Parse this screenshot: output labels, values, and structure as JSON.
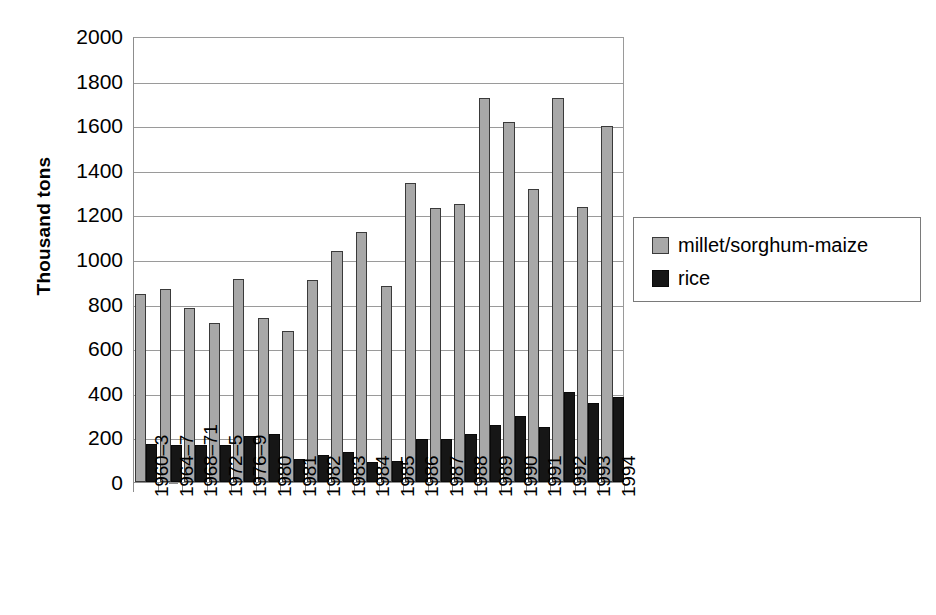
{
  "chart_data": {
    "type": "bar",
    "title": "",
    "xlabel": "",
    "ylabel": "Thousand tons",
    "ylim": [
      0,
      2000
    ],
    "ytick_step": 200,
    "yticks": [
      2000,
      1800,
      1600,
      1400,
      1200,
      1000,
      800,
      600,
      400,
      200,
      0
    ],
    "grid": true,
    "legend_position": "right",
    "categories": [
      "1960–3",
      "1964–7",
      "1968–71",
      "1972–5",
      "1976–9",
      "1980",
      "1981",
      "1982",
      "1983",
      "1984",
      "1985",
      "1986",
      "1987",
      "1988",
      "1989",
      "1990",
      "1991",
      "1992",
      "1993",
      "1994"
    ],
    "series": [
      {
        "name": "millet/sorghum-maize",
        "color": "#a8a8a8",
        "values": [
          845,
          865,
          780,
          715,
          910,
          735,
          675,
          905,
          1035,
          1120,
          880,
          1340,
          1230,
          1245,
          1720,
          1615,
          1315,
          1720,
          1235,
          1595
        ]
      },
      {
        "name": "rice",
        "color": "#161616",
        "values": [
          170,
          165,
          165,
          165,
          205,
          215,
          105,
          120,
          135,
          90,
          95,
          195,
          195,
          215,
          255,
          295,
          245,
          405,
          355,
          380
        ]
      }
    ]
  },
  "legend": {
    "entries": [
      {
        "label": "millet/sorghum-maize",
        "swatch": "millet"
      },
      {
        "label": "rice",
        "swatch": "rice"
      }
    ]
  },
  "axis": {
    "y_title": "Thousand tons"
  },
  "colors": {
    "millet": "#a8a8a8",
    "rice": "#161616",
    "grid": "#9a9a9a",
    "axis": "#8d8d8d",
    "background": "#ffffff"
  }
}
